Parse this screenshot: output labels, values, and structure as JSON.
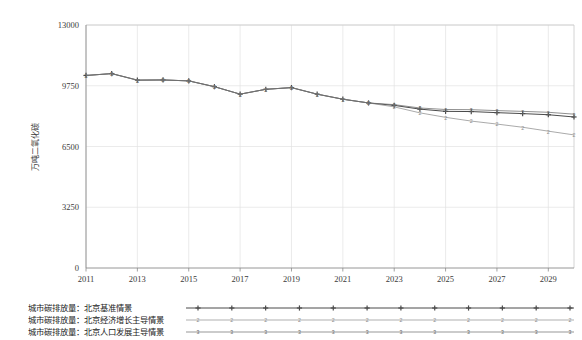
{
  "chart_data": {
    "type": "line",
    "title": "",
    "xlabel": "",
    "ylabel": "万吨二氧化碳",
    "ylim": [
      0,
      13000
    ],
    "xlim": [
      2011,
      2030
    ],
    "grid": true,
    "legend_position": "bottom",
    "y_ticks": [
      "0",
      "3250",
      "6500",
      "9750",
      "13000"
    ],
    "y_tick_values": [
      0,
      3250,
      6500,
      9750,
      13000
    ],
    "x_ticks": [
      "2011",
      "2013",
      "2015",
      "2017",
      "2019",
      "2021",
      "2023",
      "2025",
      "2027",
      "2029"
    ],
    "x_tick_values": [
      2011,
      2013,
      2015,
      2017,
      2019,
      2021,
      2023,
      2025,
      2027,
      2029
    ],
    "x": [
      2011,
      2012,
      2013,
      2014,
      2015,
      2016,
      2017,
      2018,
      2019,
      2020,
      2021,
      2022,
      2023,
      2024,
      2025,
      2026,
      2027,
      2028,
      2029,
      2030
    ],
    "series": [
      {
        "name": "城市碳排放量：北京基准情景",
        "marker": "+",
        "color": "#4a4a4a",
        "values": [
          10300,
          10400,
          10050,
          10060,
          10010,
          9700,
          9300,
          9560,
          9650,
          9300,
          9030,
          8830,
          8700,
          8500,
          8380,
          8370,
          8310,
          8260,
          8200,
          8080
        ]
      },
      {
        "name": "城市碳排放量：北京经济增长主导情景",
        "marker": "2",
        "color": "#8e8e8e",
        "values": [
          10300,
          10400,
          10050,
          10060,
          10010,
          9700,
          9300,
          9560,
          9650,
          9300,
          9030,
          8830,
          8620,
          8300,
          8060,
          7860,
          7700,
          7530,
          7320,
          7120
        ]
      },
      {
        "name": "城市碳排放量：北京人口发展主导情景",
        "marker": "3",
        "color": "#6b6b6b",
        "values": [
          10300,
          10400,
          10050,
          10060,
          10010,
          9700,
          9300,
          9560,
          9650,
          9300,
          9030,
          8830,
          8740,
          8560,
          8480,
          8470,
          8420,
          8380,
          8330,
          8230
        ]
      }
    ]
  },
  "legend": {
    "items": [
      {
        "label": "城市碳排放量：北京基准情景",
        "marker": "+"
      },
      {
        "label": "城市碳排放量：北京经济增长主导情景",
        "marker": "2"
      },
      {
        "label": "城市碳排放量：北京人口发展主导情景",
        "marker": "3"
      }
    ]
  },
  "colors": {
    "grid": "#e2e2e2",
    "frame": "#c9c9c9",
    "text": "#3b3b3b",
    "background": "#ffffff"
  }
}
